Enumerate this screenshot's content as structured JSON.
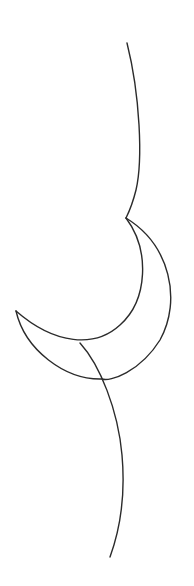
{
  "drawing": {
    "background": "#ffffff",
    "stroke_color": "#2b2b2b",
    "stroke_width": 1.4,
    "paths": {
      "upper_curve": "M127 43 C 140 95, 143 160, 136 190 C 133 202, 130 210, 126 218",
      "crescent_inner": "M126 218 C 150 250, 148 300, 120 325 C 95 348, 55 345, 16 311",
      "crescent_outer": "M126 218 C 170 245, 182 300, 160 340 C 140 372, 110 382, 102 379 C 65 380, 25 350, 16 311",
      "lower_stem": "M80 343 C 100 365, 118 410, 122 455 C 126 500, 118 535, 110 557"
    }
  }
}
